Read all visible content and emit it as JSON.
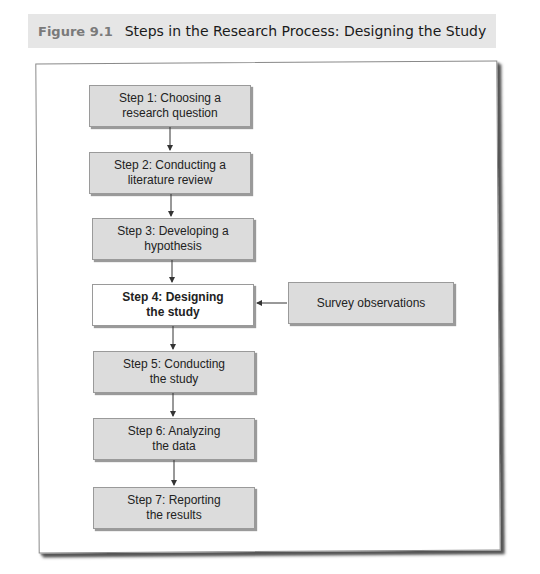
{
  "caption": {
    "figure_number": "Figure 9.1",
    "title": "Steps in the Research Process: Designing the Study"
  },
  "steps": [
    {
      "line1": "Step 1: Choosing a",
      "line2": "research question",
      "active": false
    },
    {
      "line1": "Step 2: Conducting a",
      "line2": "literature review",
      "active": false
    },
    {
      "line1": "Step 3: Developing a",
      "line2": "hypothesis",
      "active": false
    },
    {
      "line1": "Step 4: Designing",
      "line2": "the study",
      "active": true
    },
    {
      "line1": "Step 5: Conducting",
      "line2": "the study",
      "active": false
    },
    {
      "line1": "Step 6: Analyzing",
      "line2": "the data",
      "active": false
    },
    {
      "line1": "Step 7: Reporting",
      "line2": "the results",
      "active": false
    }
  ],
  "side_input": {
    "label": "Survey observations",
    "feeds_into_step": 4
  },
  "colors": {
    "box_fill": "#dcdcdc",
    "active_box_fill": "#ffffff",
    "caption_band": "#e6e6e6",
    "figure_number": "#7a7a7a"
  }
}
